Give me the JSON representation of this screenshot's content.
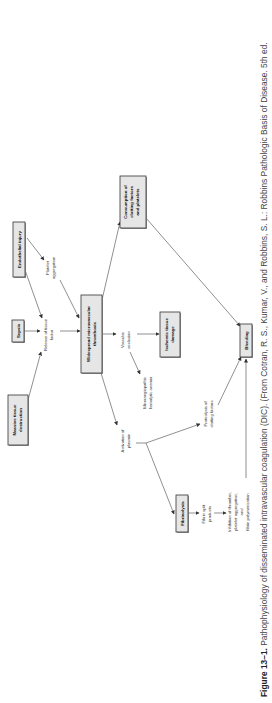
{
  "figure": {
    "rotation": "90deg counter-clockwise (text reads bottom to top)",
    "nodes": [
      {
        "id": "massive",
        "label": [
          "Massive tissue",
          "destruction"
        ]
      },
      {
        "id": "sepsis",
        "label": [
          "Sepsis"
        ]
      },
      {
        "id": "endothelial",
        "label": [
          "Endothelial injury"
        ]
      },
      {
        "id": "thrombosis",
        "label": [
          "Widespread microvascular",
          "thrombosis"
        ]
      },
      {
        "id": "consumption",
        "label": [
          "Consumption of",
          "clotting factors",
          "and platelets"
        ]
      },
      {
        "id": "ischemic",
        "label": [
          "Ischemic tissue",
          "damage"
        ]
      },
      {
        "id": "fibrinolysis",
        "label": [
          "Fibrinolysis"
        ]
      },
      {
        "id": "bleeding",
        "label": [
          "Bleeding"
        ]
      }
    ],
    "edge_labels": {
      "release": [
        "Release of tissue",
        "factor"
      ],
      "platelet": [
        "Platelet",
        "aggregation"
      ],
      "vascular": [
        "Vascular",
        "occlusion"
      ],
      "micro": [
        "Microangiopathic",
        "hemolytic anemia"
      ],
      "activation": [
        "Activation of",
        "plasmin"
      ],
      "proteolysis": [
        "Proteolysis of",
        "clotting factors"
      ],
      "fsp": [
        "Fibrin split",
        "products"
      ],
      "inhibition": [
        "Inhibition of thrombin,",
        "platelet aggregation,",
        "and",
        "fibrin polymerization"
      ]
    }
  },
  "caption": {
    "figure_number": "Figure 13–1.",
    "text": " Pathophysiology of disseminated intravascular coagulation (DIC). (From Cotran, R. S., Kumar, V., and Robbins, S. L.: Robbins Pathologic Basis of Disease. 5th ed."
  }
}
